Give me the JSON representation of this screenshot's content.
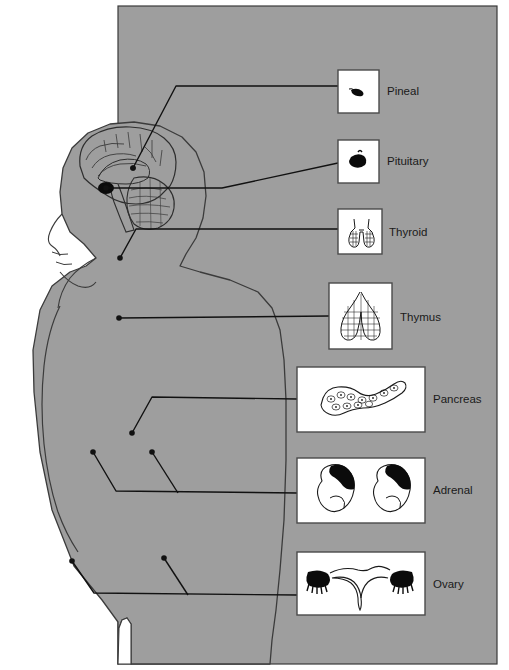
{
  "figure": {
    "background_color": "#ffffff",
    "panel_color": "#9e9e9e",
    "panel_border_color": "#3a3a3a",
    "body_color": "#9e9e9e",
    "body_outline_color": "#3b3b3b",
    "box_fill": "#ffffff",
    "box_border_color": "#4a4a4a",
    "leader_color": "#111111",
    "label_color": "#1a1a1a"
  },
  "panel": {
    "x": 118,
    "y": 6,
    "width": 379,
    "height": 658
  },
  "figure_parts": [
    {
      "name": "head-profile",
      "label": "Head in left profile"
    },
    {
      "name": "brain-sagittal",
      "label": "Mid-sagittal brain section"
    },
    {
      "name": "cerebellum",
      "label": "Cerebellum"
    },
    {
      "name": "brainstem",
      "label": "Brainstem"
    },
    {
      "name": "torso-silhouette",
      "label": "Female torso silhouette"
    },
    {
      "name": "arm-silhouette",
      "label": "Arm"
    },
    {
      "name": "legs-gap",
      "label": "Gap between legs"
    }
  ],
  "glands": [
    {
      "id": "pineal",
      "label": "Pineal",
      "box": {
        "x": 338,
        "y": 70,
        "width": 41,
        "height": 43
      },
      "label_pos": {
        "x": 387,
        "y": 95
      },
      "icon": "pineal-gland-icon",
      "leaders": [
        {
          "dot": {
            "x": 133,
            "y": 168
          },
          "points": "133,168 176,86 338,86"
        }
      ]
    },
    {
      "id": "pituitary",
      "label": "Pituitary",
      "box": {
        "x": 338,
        "y": 140,
        "width": 41,
        "height": 43
      },
      "label_pos": {
        "x": 387,
        "y": 165
      },
      "icon": "pituitary-gland-icon",
      "leaders": [
        {
          "dot": {
            "x": 106,
            "y": 188
          },
          "points": "106,188 222,188 338,163"
        }
      ]
    },
    {
      "id": "thyroid",
      "label": "Thyroid",
      "box": {
        "x": 338,
        "y": 209,
        "width": 44,
        "height": 45
      },
      "label_pos": {
        "x": 389,
        "y": 236
      },
      "icon": "thyroid-gland-icon",
      "leaders": [
        {
          "dot": {
            "x": 120,
            "y": 258
          },
          "points": "120,258 136,229 338,229"
        }
      ]
    },
    {
      "id": "thymus",
      "label": "Thymus",
      "box": {
        "x": 329,
        "y": 283,
        "width": 63,
        "height": 66
      },
      "label_pos": {
        "x": 400,
        "y": 321
      },
      "icon": "thymus-gland-icon",
      "leaders": [
        {
          "dot": {
            "x": 119,
            "y": 318
          },
          "points": "119,318 329,316"
        }
      ]
    },
    {
      "id": "pancreas",
      "label": "Pancreas",
      "box": {
        "x": 297,
        "y": 367,
        "width": 128,
        "height": 65
      },
      "label_pos": {
        "x": 433,
        "y": 403
      },
      "icon": "pancreas-icon",
      "leaders": [
        {
          "dot": {
            "x": 132,
            "y": 433
          },
          "points": "132,433 152,397 297,399"
        }
      ]
    },
    {
      "id": "adrenal",
      "label": "Adrenal",
      "box": {
        "x": 297,
        "y": 458,
        "width": 128,
        "height": 65
      },
      "label_pos": {
        "x": 433,
        "y": 494
      },
      "icon": "adrenal-glands-kidneys-icon",
      "leaders": [
        {
          "dot": {
            "x": 93,
            "y": 452
          },
          "points": "93,452 116,491 297,493"
        },
        {
          "dot": {
            "x": 152,
            "y": 452
          },
          "points": "152,452 178,493"
        }
      ]
    },
    {
      "id": "ovary",
      "label": "Ovary",
      "box": {
        "x": 297,
        "y": 552,
        "width": 128,
        "height": 63
      },
      "label_pos": {
        "x": 433,
        "y": 588
      },
      "icon": "ovaries-uterus-icon",
      "leaders": [
        {
          "dot": {
            "x": 72,
            "y": 561
          },
          "points": "72,561 94,593 297,595"
        },
        {
          "dot": {
            "x": 164,
            "y": 558
          },
          "points": "164,558 188,595"
        }
      ]
    }
  ]
}
